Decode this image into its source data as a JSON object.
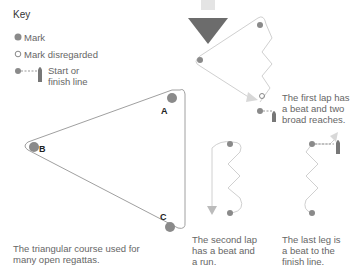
{
  "key": {
    "title": "Key",
    "items": [
      {
        "icon": "filled-mark-icon",
        "label": "Mark"
      },
      {
        "icon": "hollow-mark-icon",
        "label": "Mark disregarded"
      },
      {
        "icon": "start-finish-line-icon",
        "label_line1": "Start or",
        "label_line2": "finish line"
      }
    ]
  },
  "wind_arrow": {
    "icon": "wind-direction-arrow-icon"
  },
  "triangle": {
    "marks": [
      "A",
      "B",
      "C"
    ],
    "caption_line1": "The triangular course used for",
    "caption_line2": "many open regattas."
  },
  "first_lap": {
    "line1": "The first lap has",
    "line2": "a beat and two",
    "line3": "broad reaches."
  },
  "second_lap": {
    "line1": "The second lap",
    "line2": "has a beat and",
    "line3": "a run."
  },
  "last_leg": {
    "line1": "The last leg is",
    "line2": "a beat to the",
    "line3": "finish line."
  },
  "colors": {
    "mark": "#8a8a8a",
    "line": "#9a9a9a",
    "arrow": "#666666",
    "course": "#d8d8d8"
  }
}
